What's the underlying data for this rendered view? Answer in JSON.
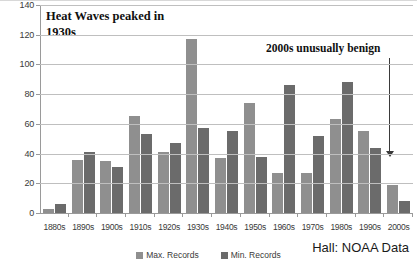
{
  "chart_data": {
    "type": "bar",
    "title": "",
    "xlabel": "",
    "ylabel": "",
    "ylim": [
      0,
      140
    ],
    "ytick_step": 20,
    "yticks": [
      0,
      20,
      40,
      60,
      80,
      100,
      120,
      140
    ],
    "grid": true,
    "legend_position": "bottom-center",
    "categories": [
      "1880s",
      "1890s",
      "1900s",
      "1910s",
      "1920s",
      "1930s",
      "1940s",
      "1950s",
      "1960s",
      "1970s",
      "1980s",
      "1990s",
      "2000s"
    ],
    "series": [
      {
        "name": "Max. Records",
        "color": "#8f8f8f",
        "values": [
          3,
          36,
          35,
          65,
          41,
          117,
          37,
          74,
          27,
          27,
          63,
          55,
          19
        ]
      },
      {
        "name": "Min. Records",
        "color": "#6b6b6b",
        "values": [
          6,
          41,
          31,
          53,
          47,
          57,
          55,
          38,
          86,
          52,
          88,
          44,
          8
        ]
      }
    ],
    "annotations": [
      {
        "id": "heat-waves",
        "text": "Heat Waves peaked in 1930s"
      },
      {
        "id": "benign",
        "text": "2000s unusually benign"
      },
      {
        "id": "arrow",
        "text": "",
        "icon": "down-arrow-icon"
      }
    ],
    "source": "Hall: NOAA Data"
  },
  "annotations": {
    "heat_waves_line1": "Heat Waves peaked in",
    "heat_waves_line2": "1930s",
    "benign": "2000s unusually benign"
  },
  "legend": {
    "items": [
      {
        "label": "Max. Records"
      },
      {
        "label": "Min. Records"
      }
    ]
  },
  "source": {
    "text": "Hall: NOAA Data"
  }
}
